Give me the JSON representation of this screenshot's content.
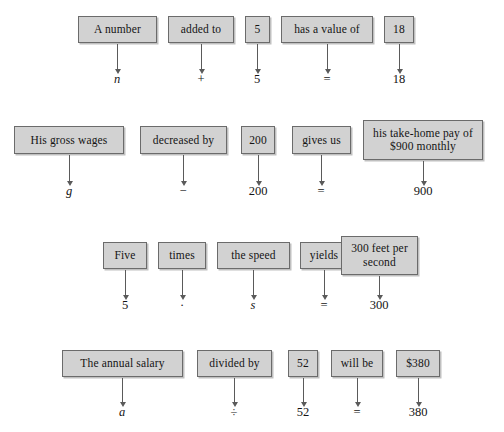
{
  "figure": {
    "type": "word-to-symbol translation diagram",
    "box_fill_color": "#d2d2d2",
    "box_border_color": "#6b6b6b",
    "background_color": "#ffffff",
    "arrow_color": "#5a5a5a"
  },
  "rows": [
    {
      "id": "row-1",
      "phrase_boxes": [
        {
          "text": "A number",
          "x": 78,
          "y": 16,
          "w": 79,
          "h": 27
        },
        {
          "text": "added to",
          "x": 168,
          "y": 16,
          "w": 66,
          "h": 27
        },
        {
          "text": "5",
          "x": 245,
          "y": 16,
          "w": 25,
          "h": 27
        },
        {
          "text": "has a value of",
          "x": 281,
          "y": 16,
          "w": 92,
          "h": 27
        },
        {
          "text": "18",
          "x": 384,
          "y": 16,
          "w": 30,
          "h": 27
        }
      ],
      "arrows": [
        {
          "x": 117,
          "y": 44,
          "len": 26
        },
        {
          "x": 201,
          "y": 44,
          "len": 26
        },
        {
          "x": 257,
          "y": 44,
          "len": 26
        },
        {
          "x": 327,
          "y": 44,
          "len": 26
        },
        {
          "x": 399,
          "y": 44,
          "len": 26
        }
      ],
      "symbols": [
        {
          "text": "n",
          "x": 117,
          "y": 72,
          "italic": true
        },
        {
          "text": "+",
          "x": 201,
          "y": 72,
          "italic": false
        },
        {
          "text": "5",
          "x": 257,
          "y": 72,
          "italic": false
        },
        {
          "text": "=",
          "x": 327,
          "y": 72,
          "italic": false
        },
        {
          "text": "18",
          "x": 399,
          "y": 72,
          "italic": false
        }
      ]
    },
    {
      "id": "row-2",
      "phrase_boxes": [
        {
          "text": "His gross wages",
          "x": 14,
          "y": 126,
          "w": 110,
          "h": 28
        },
        {
          "text": "decreased by",
          "x": 140,
          "y": 126,
          "w": 87,
          "h": 28
        },
        {
          "text": "200",
          "x": 241,
          "y": 126,
          "w": 34,
          "h": 28
        },
        {
          "text": "gives us",
          "x": 292,
          "y": 126,
          "w": 59,
          "h": 28
        },
        {
          "text": "his take-home pay of $900 monthly",
          "x": 363,
          "y": 120,
          "w": 120,
          "h": 40,
          "two_line": true
        }
      ],
      "arrows": [
        {
          "x": 69,
          "y": 155,
          "len": 27
        },
        {
          "x": 183,
          "y": 155,
          "len": 27
        },
        {
          "x": 258,
          "y": 155,
          "len": 27
        },
        {
          "x": 321,
          "y": 155,
          "len": 27
        },
        {
          "x": 423,
          "y": 161,
          "len": 21
        }
      ],
      "symbols": [
        {
          "text": "g",
          "x": 69,
          "y": 184,
          "italic": true
        },
        {
          "text": "−",
          "x": 183,
          "y": 184,
          "italic": false
        },
        {
          "text": "200",
          "x": 258,
          "y": 184,
          "italic": false
        },
        {
          "text": "=",
          "x": 321,
          "y": 184,
          "italic": false
        },
        {
          "text": "900",
          "x": 423,
          "y": 184,
          "italic": false
        }
      ]
    },
    {
      "id": "row-3",
      "phrase_boxes": [
        {
          "text": "Five",
          "x": 103,
          "y": 242,
          "w": 44,
          "h": 27
        },
        {
          "text": "times",
          "x": 158,
          "y": 242,
          "w": 48,
          "h": 27
        },
        {
          "text": "the speed",
          "x": 217,
          "y": 242,
          "w": 73,
          "h": 27
        },
        {
          "text": "yields",
          "x": 300,
          "y": 242,
          "w": 48,
          "h": 27
        },
        {
          "text": "300 feet per second",
          "x": 341,
          "y": 236,
          "w": 77,
          "h": 39,
          "two_line": true
        }
      ],
      "arrows": [
        {
          "x": 125,
          "y": 270,
          "len": 26
        },
        {
          "x": 182,
          "y": 270,
          "len": 26
        },
        {
          "x": 253,
          "y": 270,
          "len": 26
        },
        {
          "x": 324,
          "y": 270,
          "len": 26
        },
        {
          "x": 379,
          "y": 276,
          "len": 20
        }
      ],
      "symbols": [
        {
          "text": "5",
          "x": 125,
          "y": 298,
          "italic": false
        },
        {
          "text": "·",
          "x": 182,
          "y": 298,
          "italic": false
        },
        {
          "text": "s",
          "x": 253,
          "y": 298,
          "italic": true
        },
        {
          "text": "=",
          "x": 324,
          "y": 298,
          "italic": false
        },
        {
          "text": "300",
          "x": 379,
          "y": 298,
          "italic": false
        }
      ]
    },
    {
      "id": "row-4",
      "phrase_boxes": [
        {
          "text": "The annual salary",
          "x": 62,
          "y": 350,
          "w": 121,
          "h": 27
        },
        {
          "text": "divided by",
          "x": 197,
          "y": 350,
          "w": 75,
          "h": 27
        },
        {
          "text": "52",
          "x": 288,
          "y": 350,
          "w": 30,
          "h": 27
        },
        {
          "text": "will be",
          "x": 331,
          "y": 350,
          "w": 52,
          "h": 27
        },
        {
          "text": "$380",
          "x": 396,
          "y": 350,
          "w": 44,
          "h": 27
        }
      ],
      "arrows": [
        {
          "x": 122,
          "y": 378,
          "len": 25
        },
        {
          "x": 234,
          "y": 378,
          "len": 25
        },
        {
          "x": 303,
          "y": 378,
          "len": 25
        },
        {
          "x": 357,
          "y": 378,
          "len": 25
        },
        {
          "x": 418,
          "y": 378,
          "len": 25
        }
      ],
      "symbols": [
        {
          "text": "a",
          "x": 122,
          "y": 405,
          "italic": true
        },
        {
          "text": "÷",
          "x": 234,
          "y": 405,
          "italic": false
        },
        {
          "text": "52",
          "x": 303,
          "y": 405,
          "italic": false
        },
        {
          "text": "=",
          "x": 357,
          "y": 405,
          "italic": false
        },
        {
          "text": "380",
          "x": 418,
          "y": 405,
          "italic": false
        }
      ]
    }
  ]
}
